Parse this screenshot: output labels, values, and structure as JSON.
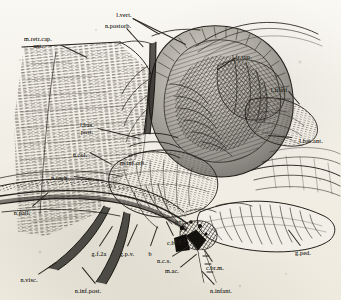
{
  "plate": {
    "title": "Cephalopod cephalic nervous system — lateral dissection",
    "background_color": "#f4f2ec",
    "ink_color": "#231f1a",
    "width": 341,
    "height": 300,
    "technique": "steel engraving / hatched line plate"
  },
  "labels": [
    {
      "id": "m-retr-cap-ant",
      "text": "m.retr.cap.\nant.",
      "x": 38,
      "y": 36,
      "align": "c"
    },
    {
      "id": "n-postorb",
      "text": "n.postorb.",
      "x": 118,
      "y": 23,
      "align": "c"
    },
    {
      "id": "l-vert",
      "text": "l.vert.",
      "x": 124,
      "y": 12,
      "align": "c"
    },
    {
      "id": "l-fr-sup",
      "text": "l.fr.sup.",
      "x": 242,
      "y": 54,
      "align": "c"
    },
    {
      "id": "l-fr-inf",
      "text": "l.fr.inf.",
      "x": 280,
      "y": 87,
      "align": "c"
    },
    {
      "id": "l-bas-post",
      "text": "l.bas.\npost.",
      "x": 87,
      "y": 122,
      "align": "c"
    },
    {
      "id": "l-bas-ant",
      "text": "l.bas.ant.",
      "x": 311,
      "y": 138,
      "align": "c"
    },
    {
      "id": "n-col",
      "text": "n.col.",
      "x": 80,
      "y": 152,
      "align": "c"
    },
    {
      "id": "m-inf-orb",
      "text": "m.inf.orb.",
      "x": 133,
      "y": 160,
      "align": "c"
    },
    {
      "id": "n-rach",
      "text": "n.rach.",
      "x": 60,
      "y": 175,
      "align": "c"
    },
    {
      "id": "n-pall",
      "text": "n.pall.",
      "x": 22,
      "y": 210,
      "align": "c"
    },
    {
      "id": "p-plus-c",
      "text": "p+c",
      "x": 180,
      "y": 219,
      "align": "c"
    },
    {
      "id": "g-c-i",
      "text": "g.c.i",
      "x": 180,
      "y": 237,
      "align": "c"
    },
    {
      "id": "g-f-2a",
      "text": "g.f.2a",
      "x": 99,
      "y": 251,
      "align": "c"
    },
    {
      "id": "g-p-v",
      "text": "g.p.v.",
      "x": 127,
      "y": 251,
      "align": "c"
    },
    {
      "id": "b",
      "text": "b",
      "x": 150,
      "y": 251,
      "align": "c"
    },
    {
      "id": "c-br-v",
      "text": "c.br.v.",
      "x": 175,
      "y": 240,
      "align": "c"
    },
    {
      "id": "n-c-s",
      "text": "n.c.s.",
      "x": 164,
      "y": 258,
      "align": "c"
    },
    {
      "id": "m-ac",
      "text": "m.ac.",
      "x": 172,
      "y": 268,
      "align": "c"
    },
    {
      "id": "c-br-m",
      "text": "c.br.m.",
      "x": 215,
      "y": 265,
      "align": "c"
    },
    {
      "id": "g-ped",
      "text": "g.ped.",
      "x": 303,
      "y": 250,
      "align": "c"
    },
    {
      "id": "n-visc",
      "text": "n.visc.",
      "x": 29,
      "y": 277,
      "align": "c"
    },
    {
      "id": "n-inf-post",
      "text": "n.inf.post.",
      "x": 88,
      "y": 288,
      "align": "c"
    },
    {
      "id": "n-infant",
      "text": "n.infant.",
      "x": 221,
      "y": 288,
      "align": "c"
    }
  ],
  "leaders": [
    {
      "id": "ld-m-retr-cap",
      "x1": 62,
      "y1": 45,
      "x2": 87,
      "y2": 57
    },
    {
      "id": "ld-n-postorb",
      "x1": 127,
      "y1": 28,
      "x2": 144,
      "y2": 47
    },
    {
      "id": "ld-l-vert-a",
      "x1": 133,
      "y1": 18,
      "x2": 160,
      "y2": 34
    },
    {
      "id": "ld-l-vert-b",
      "x1": 133,
      "y1": 18,
      "x2": 186,
      "y2": 44
    },
    {
      "id": "ld-l-fr-sup",
      "x1": 236,
      "y1": 58,
      "x2": 218,
      "y2": 70
    },
    {
      "id": "ld-l-fr-inf",
      "x1": 289,
      "y1": 91,
      "x2": 300,
      "y2": 104
    },
    {
      "id": "ld-l-bas-post",
      "x1": 98,
      "y1": 128,
      "x2": 140,
      "y2": 138
    },
    {
      "id": "ld-l-bas-ant",
      "x1": 292,
      "y1": 138,
      "x2": 268,
      "y2": 136
    },
    {
      "id": "ld-n-col",
      "x1": 90,
      "y1": 152,
      "x2": 112,
      "y2": 164
    },
    {
      "id": "ld-n-rach",
      "x1": 74,
      "y1": 176,
      "x2": 104,
      "y2": 180
    },
    {
      "id": "ld-n-pall",
      "x1": 32,
      "y1": 206,
      "x2": 48,
      "y2": 192
    },
    {
      "id": "ld-g-f-2a",
      "x1": 99,
      "y1": 246,
      "x2": 112,
      "y2": 226
    },
    {
      "id": "ld-g-p-v",
      "x1": 127,
      "y1": 246,
      "x2": 137,
      "y2": 224
    },
    {
      "id": "ld-b",
      "x1": 150,
      "y1": 246,
      "x2": 157,
      "y2": 226
    },
    {
      "id": "ld-c-br-v",
      "x1": 173,
      "y1": 236,
      "x2": 166,
      "y2": 222
    },
    {
      "id": "ld-n-c-s",
      "x1": 172,
      "y1": 256,
      "x2": 188,
      "y2": 246
    },
    {
      "id": "ld-m-ac",
      "x1": 180,
      "y1": 267,
      "x2": 196,
      "y2": 254
    },
    {
      "id": "ld-c-br-m",
      "x1": 212,
      "y1": 262,
      "x2": 204,
      "y2": 250
    },
    {
      "id": "ld-g-ped",
      "x1": 300,
      "y1": 246,
      "x2": 288,
      "y2": 230
    },
    {
      "id": "ld-n-visc",
      "x1": 38,
      "y1": 274,
      "x2": 56,
      "y2": 262
    },
    {
      "id": "ld-n-inf-post",
      "x1": 95,
      "y1": 284,
      "x2": 82,
      "y2": 268
    },
    {
      "id": "ld-n-infant",
      "x1": 214,
      "y1": 285,
      "x2": 202,
      "y2": 272
    }
  ]
}
